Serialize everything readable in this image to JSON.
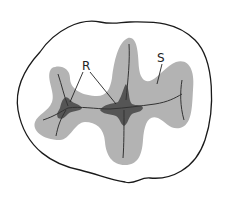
{
  "diagram": {
    "labels": {
      "R": "R",
      "S": "S"
    },
    "colors": {
      "outline": "#1a1a1a",
      "shaded_region": "#b3b3b3",
      "dark_region": "#555555",
      "fissure_line": "#333333",
      "background": "#ffffff"
    }
  }
}
